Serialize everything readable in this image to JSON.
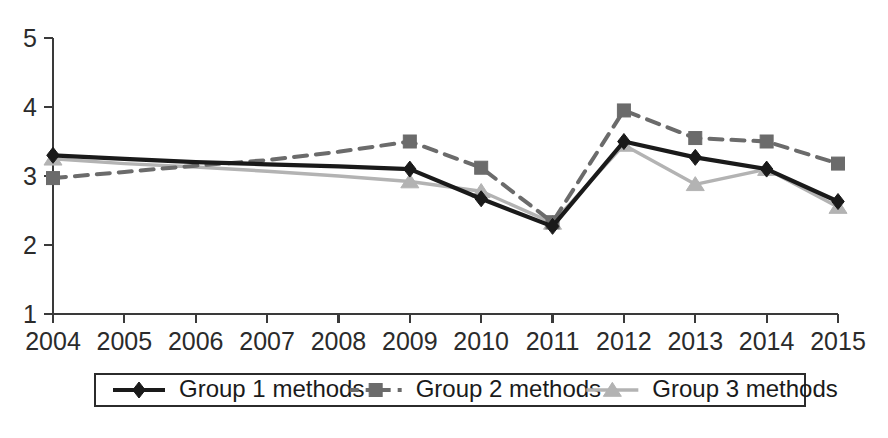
{
  "chart_data": {
    "type": "line",
    "title": "",
    "subtitle": "",
    "xlabel": "",
    "ylabel": "",
    "categories": [
      "2004",
      "2005",
      "2006",
      "2007",
      "2008",
      "2009",
      "2010",
      "2011",
      "2012",
      "2013",
      "2014",
      "2015"
    ],
    "x": [
      2004,
      2005,
      2006,
      2007,
      2008,
      2009,
      2010,
      2011,
      2012,
      2013,
      2014,
      2015
    ],
    "ylim": [
      1,
      5
    ],
    "xlim": [
      2004,
      2015
    ],
    "yticks": [
      1,
      2,
      3,
      4,
      5
    ],
    "ytick_labels": [
      "1",
      "2",
      "3",
      "4",
      "5"
    ],
    "xtick_labels": [
      "2004",
      "2005",
      "2006",
      "2007",
      "2008",
      "2009",
      "2010",
      "2011",
      "2012",
      "2013",
      "2014",
      "2015"
    ],
    "grid": false,
    "legend_position": "bottom",
    "series": [
      {
        "name": "Group 1 methods",
        "values": [
          3.3,
          3.25,
          3.2,
          3.17,
          3.14,
          3.1,
          2.67,
          2.27,
          3.5,
          3.27,
          3.1,
          2.63
        ],
        "color": "#1a1a1a",
        "line_style": "solid",
        "marker": "diamond",
        "marker_years": [
          2004,
          2009,
          2010,
          2011,
          2012,
          2013,
          2014,
          2015
        ]
      },
      {
        "name": "Group 2 methods",
        "values": [
          2.97,
          3.06,
          3.15,
          3.23,
          3.35,
          3.5,
          3.12,
          2.33,
          3.95,
          3.55,
          3.5,
          3.18
        ],
        "color": "#6b6b6b",
        "line_style": "dashed",
        "marker": "square",
        "marker_years": [
          2004,
          2009,
          2010,
          2011,
          2012,
          2013,
          2014,
          2015
        ]
      },
      {
        "name": "Group 3 methods",
        "values": [
          3.25,
          3.18,
          3.13,
          3.07,
          3.0,
          2.92,
          2.78,
          2.32,
          3.45,
          2.88,
          3.1,
          2.55
        ],
        "color": "#b3b3b3",
        "line_style": "solid",
        "marker": "triangle",
        "marker_years": [
          2004,
          2009,
          2010,
          2011,
          2012,
          2013,
          2014,
          2015
        ]
      }
    ]
  },
  "legend": {
    "entries": [
      {
        "label": "Group 1 methods"
      },
      {
        "label": "Group 2 methods"
      },
      {
        "label": "Group 3 methods"
      }
    ]
  },
  "axes": {
    "y_labels": [
      "5",
      "4",
      "3",
      "2",
      "1"
    ],
    "x_labels": [
      "2004",
      "2005",
      "2006",
      "2007",
      "2008",
      "2009",
      "2010",
      "2011",
      "2012",
      "2013",
      "2014",
      "2015"
    ]
  },
  "colors": {
    "series_1": "#1a1a1a",
    "series_2": "#6b6b6b",
    "series_3": "#b3b3b3",
    "axis": "#3a3a3a",
    "text": "#2b2b2b",
    "background": "#ffffff"
  }
}
